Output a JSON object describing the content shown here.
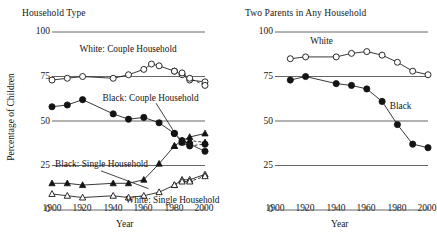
{
  "figure": {
    "width": 437,
    "height": 242,
    "background": "#ffffff",
    "ink_color": "#141414",
    "grid_color": "#555555"
  },
  "chart_data": [
    {
      "id": "household-type",
      "type": "line",
      "title": "Household Type",
      "xlabel": "Year",
      "ylabel": "Percentage of Children",
      "xlim": [
        1900,
        2000
      ],
      "ylim": [
        0,
        100
      ],
      "xticks": [
        1900,
        1920,
        1940,
        1960,
        1980,
        2000
      ],
      "yticks": [
        0,
        25,
        50,
        75,
        100
      ],
      "grid": "horizontal",
      "legend": "inline-annotations",
      "series": [
        {
          "name": "White: Couple Household",
          "marker": "open-circle",
          "linestyle": "solid",
          "label_x": 1918,
          "label_y": 89,
          "x": [
            1900,
            1910,
            1920,
            1940,
            1950,
            1960,
            1965,
            1970,
            1980,
            1985,
            1990,
            2000
          ],
          "values": [
            73,
            74,
            75,
            74,
            76,
            79,
            82,
            81,
            78,
            76,
            73,
            72
          ]
        },
        {
          "name": "White: Couple Household (alt)",
          "marker": "open-circle",
          "linestyle": "dashed",
          "x": [
            1980,
            1985,
            1990,
            2000
          ],
          "values": [
            78,
            77,
            74,
            70
          ]
        },
        {
          "name": "Black: Couple Household",
          "marker": "filled-circle",
          "linestyle": "solid",
          "label_x": 1933,
          "label_y": 61,
          "x": [
            1900,
            1910,
            1920,
            1940,
            1950,
            1960,
            1970,
            1980,
            1985,
            1990,
            2000
          ],
          "values": [
            58,
            59,
            62,
            54,
            51,
            52,
            49,
            43,
            39,
            37,
            33
          ]
        },
        {
          "name": "Black: Couple Household (alt)",
          "marker": "filled-circle",
          "linestyle": "dashed",
          "x": [
            1980,
            1985,
            1990,
            2000
          ],
          "values": [
            43,
            38,
            36,
            37
          ]
        },
        {
          "name": "Black: Single Household",
          "marker": "filled-triangle",
          "linestyle": "solid",
          "label_x": 1902,
          "label_y": 24,
          "x": [
            1900,
            1910,
            1920,
            1940,
            1950,
            1960,
            1970,
            1980,
            1985,
            1990,
            2000
          ],
          "values": [
            15,
            15,
            14,
            15,
            15,
            17,
            26,
            36,
            39,
            41,
            43
          ]
        },
        {
          "name": "Black: Single Household (alt)",
          "marker": "filled-triangle",
          "linestyle": "dashed",
          "x": [
            1980,
            1985,
            1990,
            2000
          ],
          "values": [
            36,
            38,
            39,
            38
          ]
        },
        {
          "name": "White: Single Household",
          "marker": "open-triangle",
          "linestyle": "solid",
          "label_x": 1948,
          "label_y": 4,
          "x": [
            1900,
            1910,
            1920,
            1940,
            1950,
            1960,
            1970,
            1980,
            1985,
            1990,
            2000
          ],
          "values": [
            9,
            8,
            7,
            8,
            7,
            8,
            10,
            14,
            17,
            17,
            20
          ]
        },
        {
          "name": "White: Single Household (alt)",
          "marker": "open-triangle",
          "linestyle": "dashed",
          "x": [
            1980,
            1985,
            1990,
            2000
          ],
          "values": [
            14,
            16,
            16,
            19
          ]
        }
      ]
    },
    {
      "id": "two-parents-any-household",
      "type": "line",
      "title": "Two Parents in Any Household",
      "xlabel": "Year",
      "ylabel": "",
      "xlim": [
        1900,
        2000
      ],
      "ylim": [
        0,
        100
      ],
      "xticks": [
        1900,
        1920,
        1940,
        1960,
        1980,
        2000
      ],
      "yticks": [
        0,
        25,
        50,
        75,
        100
      ],
      "grid": "horizontal",
      "legend": "inline-annotations",
      "series": [
        {
          "name": "White",
          "marker": "open-circle",
          "linestyle": "solid",
          "label_x": 1923,
          "label_y": 93,
          "x": [
            1910,
            1920,
            1940,
            1950,
            1960,
            1970,
            1980,
            1990,
            2000
          ],
          "values": [
            85,
            86,
            86,
            88,
            89,
            87,
            83,
            78,
            76
          ]
        },
        {
          "name": "Black",
          "marker": "filled-circle",
          "linestyle": "solid",
          "label_x": 1975,
          "label_y": 57,
          "x": [
            1910,
            1920,
            1940,
            1950,
            1960,
            1970,
            1980,
            1990,
            2000
          ],
          "values": [
            73,
            75,
            71,
            70,
            68,
            61,
            48,
            37,
            35
          ]
        }
      ]
    }
  ],
  "axes": {
    "left": {
      "title": "Household Type",
      "ylabel": "Percentage of Children",
      "xlabel": "Year",
      "yticks": [
        "100",
        "75",
        "50",
        "25",
        "0"
      ],
      "xticks": [
        "1900",
        "1920",
        "1940",
        "1960",
        "1980",
        "2000"
      ],
      "annotations": [
        "White: Couple Household",
        "Black: Couple Household",
        "Black: Single Household",
        "White: Single Household"
      ]
    },
    "right": {
      "title": "Two Parents in Any Household",
      "ylabel": "",
      "xlabel": "Year",
      "yticks": [
        "100",
        "75",
        "50",
        "25",
        "0"
      ],
      "xticks": [
        "1900",
        "1920",
        "1940",
        "1960",
        "1980",
        "2000"
      ],
      "annotations": [
        "White",
        "Black"
      ]
    }
  }
}
